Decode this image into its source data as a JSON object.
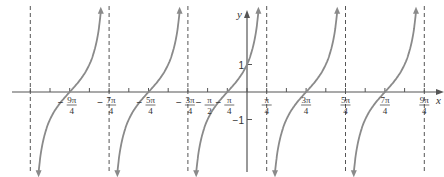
{
  "chart_data": {
    "type": "line",
    "title": "",
    "function": "y = tan(x + pi/4)",
    "xlabel": "x",
    "ylabel": "y",
    "colors": {
      "curve": "#8a8a8a",
      "axis": "#555555",
      "asymptote": "#555555"
    },
    "xlim_pi": [
      -3.0,
      2.5
    ],
    "ylim": [
      -3.2,
      3.2
    ],
    "asymptotes_pi": [
      -2.75,
      -1.75,
      -0.75,
      0.25,
      1.25,
      2.25
    ],
    "zeros_pi": [
      -2.25,
      -1.25,
      -0.25,
      0.75,
      1.75
    ],
    "x_tick_labels": [
      {
        "sign": "−",
        "num": "9π",
        "den": "4",
        "value_pi": -2.25
      },
      {
        "sign": "−",
        "num": "7π",
        "den": "4",
        "value_pi": -1.75
      },
      {
        "sign": "−",
        "num": "5π",
        "den": "4",
        "value_pi": -1.25
      },
      {
        "sign": "−",
        "num": "3π",
        "den": "4",
        "value_pi": -0.75
      },
      {
        "sign": "−",
        "num": "π",
        "den": "2",
        "value_pi": -0.5
      },
      {
        "sign": "−",
        "num": "π",
        "den": "4",
        "value_pi": -0.25
      },
      {
        "sign": "",
        "num": "π",
        "den": "4",
        "value_pi": 0.25
      },
      {
        "sign": "",
        "num": "3π",
        "den": "4",
        "value_pi": 0.75
      },
      {
        "sign": "",
        "num": "5π",
        "den": "4",
        "value_pi": 1.25
      },
      {
        "sign": "",
        "num": "7π",
        "den": "4",
        "value_pi": 1.75
      },
      {
        "sign": "",
        "num": "9π",
        "den": "4",
        "value_pi": 2.25
      }
    ],
    "y_tick_labels": [
      {
        "label": "1",
        "value": 1
      },
      {
        "label": "−1",
        "value": -1
      }
    ],
    "grid": false,
    "legend": null
  }
}
